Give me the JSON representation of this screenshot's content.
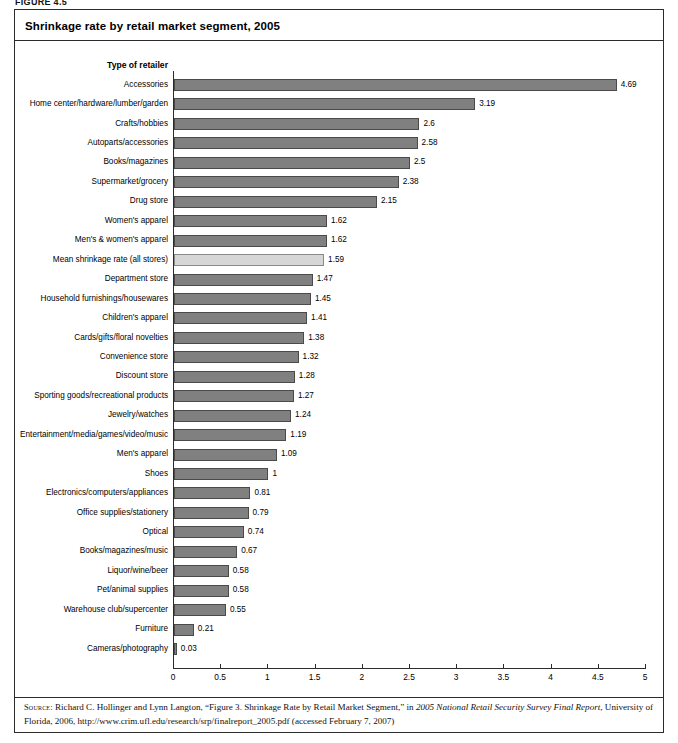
{
  "figure": {
    "tag": "FIGURE 4.5"
  },
  "title": "Shrinkage rate by retail market segment, 2005",
  "axis_header": "Type of retailer",
  "source": {
    "label": "Source:",
    "text_part1": " Richard C. Hollinger and Lynn Langton, “Figure 3. Shrinkage Rate by Retail Market Segment,” in ",
    "italic1": "2005 National Retail Security Survey Final Report",
    "text_part2": ", University of Florida, 2006, http://www.crim.ufl.edu/research/srp/finalreport_2005.pdf (accessed February 7, 2007)"
  },
  "colors": {
    "bar": "#808080",
    "bar_border": "#4a4a4a",
    "mean_bar": "#d6d6d6",
    "mean_bar_border": "#8a8a8a",
    "frame": "#2b2b2b",
    "text": "#000000"
  },
  "chart_data": {
    "type": "bar",
    "orientation": "horizontal",
    "title": "Shrinkage rate by retail market segment, 2005",
    "xlabel": "",
    "ylabel": "Type of retailer",
    "xlim": [
      0,
      5
    ],
    "xticks": [
      "0",
      "0.5",
      "1",
      "1.5",
      "2",
      "2.5",
      "3",
      "3.5",
      "4",
      "4.5",
      "5"
    ],
    "grid": false,
    "legend": null,
    "highlight_category": "Mean shrinkage rate (all stores)",
    "categories": [
      "Accessories",
      "Home center/hardware/lumber/garden",
      "Crafts/hobbies",
      "Autoparts/accessories",
      "Books/magazines",
      "Supermarket/grocery",
      "Drug store",
      "Women's apparel",
      "Men's & women's apparel",
      "Mean shrinkage rate (all stores)",
      "Department store",
      "Household furnishings/housewares",
      "Children's apparel",
      "Cards/gifts/floral novelties",
      "Convenience store",
      "Discount store",
      "Sporting goods/recreational products",
      "Jewelry/watches",
      "Entertainment/media/games/video/music",
      "Men's apparel",
      "Shoes",
      "Electronics/computers/appliances",
      "Office supplies/stationery",
      "Optical",
      "Books/magazines/music",
      "Liquor/wine/beer",
      "Pet/animal supplies",
      "Warehouse club/supercenter",
      "Furniture",
      "Cameras/photography"
    ],
    "values": [
      4.69,
      3.19,
      2.6,
      2.58,
      2.5,
      2.38,
      2.15,
      1.62,
      1.62,
      1.59,
      1.47,
      1.45,
      1.41,
      1.38,
      1.32,
      1.28,
      1.27,
      1.24,
      1.19,
      1.09,
      1,
      0.81,
      0.79,
      0.74,
      0.67,
      0.58,
      0.58,
      0.55,
      0.21,
      0.03
    ],
    "value_labels": [
      "4.69",
      "3.19",
      "2.6",
      "2.58",
      "2.5",
      "2.38",
      "2.15",
      "1.62",
      "1.62",
      "1.59",
      "1.47",
      "1.45",
      "1.41",
      "1.38",
      "1.32",
      "1.28",
      "1.27",
      "1.24",
      "1.19",
      "1.09",
      "1",
      "0.81",
      "0.79",
      "0.74",
      "0.67",
      "0.58",
      "0.58",
      "0.55",
      "0.21",
      "0.03"
    ]
  }
}
